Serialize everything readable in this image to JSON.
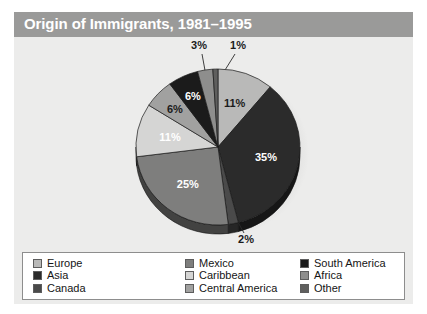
{
  "figure": {
    "title": "Origin of Immigrants, 1981–1995",
    "panel_bg": "#ececeb",
    "title_band_color": "#9a9a99",
    "title_text_color": "#ffffff"
  },
  "chart_data": {
    "type": "pie",
    "title": "Origin of Immigrants, 1981–1995",
    "subtitle": "",
    "xlabel": "",
    "ylabel": "",
    "legend_position": "bottom",
    "grid": false,
    "value_unit": "%",
    "start_angle_deg": 0,
    "direction": "clockwise",
    "categories": [
      "Europe",
      "Asia",
      "Canada",
      "Mexico",
      "Caribbean",
      "Central America",
      "South America",
      "Africa",
      "Other"
    ],
    "values": [
      11,
      35,
      2,
      25,
      11,
      6,
      6,
      3,
      1
    ],
    "colors": [
      "#b9b9b8",
      "#2b2b2b",
      "#4a4a4a",
      "#7e7e7d",
      "#d5d5d4",
      "#a1a1a0",
      "#1b1b1b",
      "#8e8e8d",
      "#5f5f5e"
    ],
    "slices": [
      {
        "label": "Europe",
        "value": 11,
        "display": "11%",
        "color": "#b9b9b8",
        "label_color": "dark",
        "callout": false
      },
      {
        "label": "Asia",
        "value": 35,
        "display": "35%",
        "color": "#2b2b2b",
        "label_color": "light",
        "callout": false
      },
      {
        "label": "Canada",
        "value": 2,
        "display": "2%",
        "color": "#4a4a4a",
        "label_color": "dark",
        "callout": true
      },
      {
        "label": "Mexico",
        "value": 25,
        "display": "25%",
        "color": "#7e7e7d",
        "label_color": "light",
        "callout": false
      },
      {
        "label": "Caribbean",
        "value": 11,
        "display": "11%",
        "color": "#d5d5d4",
        "label_color": "light",
        "callout": false
      },
      {
        "label": "Central America",
        "value": 6,
        "display": "6%",
        "color": "#a1a1a0",
        "label_color": "dark",
        "callout": false
      },
      {
        "label": "South America",
        "value": 6,
        "display": "6%",
        "color": "#1b1b1b",
        "label_color": "light",
        "callout": false
      },
      {
        "label": "Africa",
        "value": 3,
        "display": "3%",
        "color": "#8e8e8d",
        "label_color": "dark",
        "callout": true
      },
      {
        "label": "Other",
        "value": 1,
        "display": "1%",
        "color": "#5f5f5e",
        "label_color": "dark",
        "callout": true
      }
    ]
  },
  "legend": {
    "columns": 3,
    "rows": 3,
    "items": [
      {
        "label": "Europe",
        "color": "#b9b9b8"
      },
      {
        "label": "Asia",
        "color": "#2b2b2b"
      },
      {
        "label": "Canada",
        "color": "#4a4a4a"
      },
      {
        "label": "Mexico",
        "color": "#7e7e7d"
      },
      {
        "label": "Caribbean",
        "color": "#d5d5d4"
      },
      {
        "label": "Central America",
        "color": "#a1a1a0"
      },
      {
        "label": "South America",
        "color": "#1b1b1b"
      },
      {
        "label": "Africa",
        "color": "#8e8e8d"
      },
      {
        "label": "Other",
        "color": "#5f5f5e"
      }
    ]
  }
}
